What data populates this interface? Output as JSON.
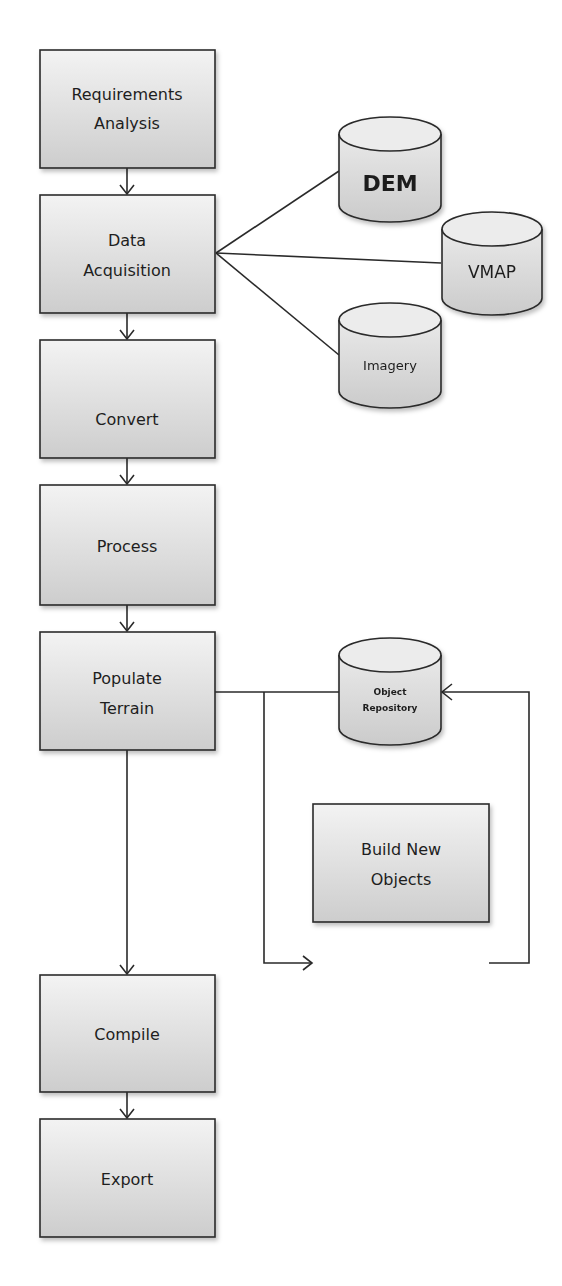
{
  "diagram": {
    "type": "flowchart",
    "colors": {
      "box_fill_top": "#f2f2f2",
      "box_fill_bottom": "#cfcfcf",
      "stroke": "#2a2a2a",
      "text": "#1e1e1e",
      "background": "#ffffff"
    },
    "process_steps": [
      {
        "id": "requirements",
        "line1": "Requirements",
        "line2": "Analysis"
      },
      {
        "id": "acquisition",
        "line1": "Data",
        "line2": "Acquisition"
      },
      {
        "id": "convert",
        "line1": "Convert",
        "line2": ""
      },
      {
        "id": "process",
        "line1": "Process",
        "line2": ""
      },
      {
        "id": "populate",
        "line1": "Populate",
        "line2": "Terrain"
      },
      {
        "id": "compile",
        "line1": "Compile",
        "line2": ""
      },
      {
        "id": "export",
        "line1": "Export",
        "line2": ""
      }
    ],
    "data_sources": [
      {
        "id": "dem",
        "label": "DEM"
      },
      {
        "id": "vmap",
        "label": "VMAP"
      },
      {
        "id": "imagery",
        "label": "Imagery"
      }
    ],
    "repository": {
      "id": "object-repository",
      "line1": "Object",
      "line2": "Repository"
    },
    "side_process": {
      "id": "build-new-objects",
      "line1": "Build New",
      "line2": "Objects"
    },
    "edges": [
      {
        "from": "Requirements Analysis",
        "to": "Data Acquisition",
        "arrow": true
      },
      {
        "from": "Data Acquisition",
        "to": "DEM",
        "arrow": false
      },
      {
        "from": "Data Acquisition",
        "to": "VMAP",
        "arrow": false
      },
      {
        "from": "Data Acquisition",
        "to": "Imagery",
        "arrow": false
      },
      {
        "from": "Data Acquisition",
        "to": "Convert",
        "arrow": true
      },
      {
        "from": "Convert",
        "to": "Process",
        "arrow": true
      },
      {
        "from": "Process",
        "to": "Populate Terrain",
        "arrow": true
      },
      {
        "from": "Populate Terrain",
        "to": "Object Repository",
        "arrow": false
      },
      {
        "from": "Populate Terrain",
        "to": "Build New Objects",
        "arrow": true
      },
      {
        "from": "Build New Objects",
        "to": "Object Repository",
        "arrow": true
      },
      {
        "from": "Populate Terrain",
        "to": "Compile",
        "arrow": true
      },
      {
        "from": "Compile",
        "to": "Export",
        "arrow": true
      }
    ]
  }
}
